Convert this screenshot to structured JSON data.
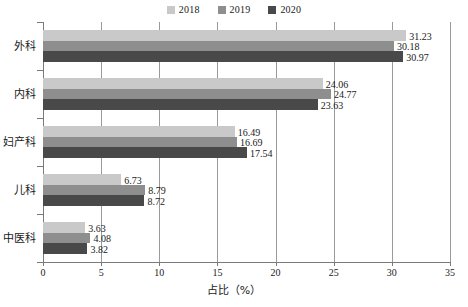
{
  "chart_data": {
    "type": "bar",
    "orientation": "horizontal",
    "title": "",
    "xlabel": "占比（%）",
    "ylabel": "",
    "xlim": [
      0,
      35
    ],
    "xticks": [
      0,
      5,
      10,
      15,
      20,
      25,
      30,
      35
    ],
    "grid": true,
    "grid_axis": "x",
    "legend_position": "top-center",
    "categories": [
      "外科",
      "内科",
      "妇产科",
      "儿科",
      "中医科"
    ],
    "series": [
      {
        "name": "2018",
        "color": "#c9c9c9",
        "values": [
          31.23,
          24.06,
          16.49,
          6.73,
          3.63
        ]
      },
      {
        "name": "2019",
        "color": "#8e8e8e",
        "values": [
          30.18,
          24.77,
          16.69,
          8.79,
          4.08
        ]
      },
      {
        "name": "2020",
        "color": "#494949",
        "values": [
          30.97,
          23.63,
          17.54,
          8.72,
          3.82
        ]
      }
    ],
    "value_labels": [
      [
        "31.23",
        "30.18",
        "30.97"
      ],
      [
        "24.06",
        "24.77",
        "23.63"
      ],
      [
        "16.49",
        "16.69",
        "17.54"
      ],
      [
        "6.73",
        "8.79",
        "8.72"
      ],
      [
        "3.63",
        "4.08",
        "3.82"
      ]
    ]
  },
  "legend": {
    "items": [
      {
        "label": "2018",
        "color": "#c9c9c9"
      },
      {
        "label": "2019",
        "color": "#8e8e8e"
      },
      {
        "label": "2020",
        "color": "#494949"
      }
    ]
  },
  "axis": {
    "x_title": "占比（%）",
    "x_tick_labels": [
      "0",
      "5",
      "10",
      "15",
      "20",
      "25",
      "30",
      "35"
    ],
    "y_tick_labels": [
      "外科",
      "内科",
      "妇产科",
      "儿科",
      "中医科"
    ]
  },
  "colors": {
    "axis": "#7a7a7a",
    "grid": "#9a9a9a",
    "text": "#1a1a1a",
    "background": "#ffffff"
  }
}
